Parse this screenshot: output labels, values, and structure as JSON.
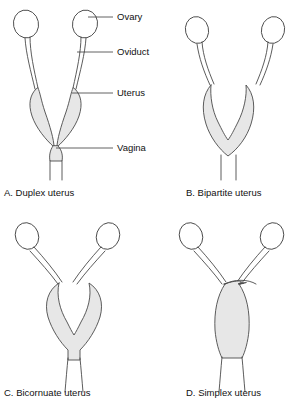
{
  "figure": {
    "background_color": "#ffffff",
    "outline_color": "#4a4a4a",
    "fill_color": "#e7e7e7",
    "text_color": "#111111"
  },
  "callouts": [
    {
      "id": "ovary",
      "label": "Ovary",
      "icon": "leader-line-icon"
    },
    {
      "id": "oviduct",
      "label": "Oviduct",
      "icon": "leader-line-icon"
    },
    {
      "id": "uterus",
      "label": "Uterus",
      "icon": "leader-line-icon"
    },
    {
      "id": "vagina",
      "label": "Vagina",
      "icon": "leader-line-icon"
    }
  ],
  "panels": [
    {
      "id": "a",
      "caption": "A. Duplex uterus",
      "letter": "A",
      "name": "Duplex uterus",
      "description": "Two separate long uterine horns joining at a narrow point above a short common neck"
    },
    {
      "id": "b",
      "caption": "B. Bipartite uterus",
      "letter": "B",
      "name": "Bipartite uterus",
      "description": "Horns fused into a shared body with a deep V notch at the top"
    },
    {
      "id": "c",
      "caption": "C. Bicornuate uterus",
      "letter": "C",
      "name": "Bicornuate uterus",
      "description": "Heart shaped body with a deep median notch and short fused base"
    },
    {
      "id": "d",
      "caption": "D. Simplex uterus",
      "letter": "D",
      "name": "Simplex uterus",
      "description": "Single pear shaped body with a flat arched top and no notch"
    }
  ]
}
